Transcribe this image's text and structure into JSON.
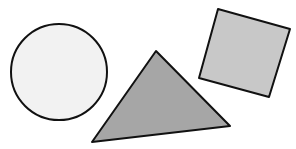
{
  "canvas": {
    "width": 296,
    "height": 149,
    "background": "#ffffff"
  },
  "shapes": {
    "circle": {
      "label": "circle",
      "cx": 59,
      "cy": 72,
      "r": 48,
      "fill": "#f2f2f2",
      "stroke": "#111111",
      "stroke_width": 2
    },
    "triangle": {
      "label": "triangle",
      "points": "156,51 230,126 92,142",
      "fill": "#a6a6a6",
      "stroke": "#111111",
      "stroke_width": 2
    },
    "square": {
      "label": "square",
      "points": "218,9 290,29 269,97 199,78",
      "fill": "#c8c8c8",
      "stroke": "#111111",
      "stroke_width": 2
    }
  }
}
